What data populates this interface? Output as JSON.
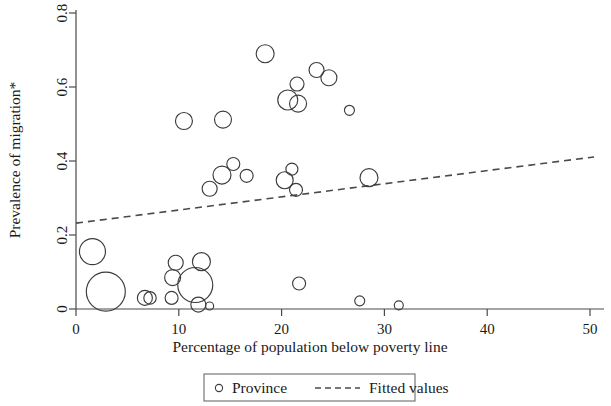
{
  "chart_data": {
    "type": "scatter",
    "title": "",
    "xlabel": "Percentage of population below poverty line",
    "ylabel": "Prevalence of migration*",
    "xlim": [
      0,
      50
    ],
    "ylim": [
      0,
      0.8
    ],
    "xticks": [
      "0",
      "10",
      "20",
      "30",
      "40",
      "50"
    ],
    "xtick_values": [
      0,
      10,
      20,
      30,
      40,
      50
    ],
    "yticks": [
      "0",
      "0.2",
      "0.4",
      "0.6",
      "0.8"
    ],
    "ytick_values": [
      0,
      0.2,
      0.4,
      0.6,
      0.8
    ],
    "grid": false,
    "marker_shape": "open-circle",
    "marker_note": "Bubble size encodes province weight (population)",
    "series": [
      {
        "name": "Province",
        "type": "bubble",
        "points": [
          {
            "x": 1.6,
            "y": 0.155,
            "size": 13.0
          },
          {
            "x": 2.9,
            "y": 0.047,
            "size": 19.5
          },
          {
            "x": 6.7,
            "y": 0.03,
            "size": 7.5
          },
          {
            "x": 7.2,
            "y": 0.03,
            "size": 6.2
          },
          {
            "x": 9.3,
            "y": 0.03,
            "size": 6.5
          },
          {
            "x": 9.4,
            "y": 0.085,
            "size": 8.0
          },
          {
            "x": 9.7,
            "y": 0.125,
            "size": 7.5
          },
          {
            "x": 11.6,
            "y": 0.065,
            "size": 17.5
          },
          {
            "x": 12.2,
            "y": 0.128,
            "size": 9.0
          },
          {
            "x": 11.9,
            "y": 0.012,
            "size": 7.5
          },
          {
            "x": 13.0,
            "y": 0.008,
            "size": 4.0
          },
          {
            "x": 10.5,
            "y": 0.508,
            "size": 8.5
          },
          {
            "x": 13.0,
            "y": 0.325,
            "size": 7.5
          },
          {
            "x": 14.2,
            "y": 0.362,
            "size": 9.0
          },
          {
            "x": 15.3,
            "y": 0.392,
            "size": 6.5
          },
          {
            "x": 16.6,
            "y": 0.36,
            "size": 6.5
          },
          {
            "x": 14.3,
            "y": 0.512,
            "size": 8.5
          },
          {
            "x": 18.4,
            "y": 0.69,
            "size": 9.0
          },
          {
            "x": 20.3,
            "y": 0.348,
            "size": 8.5
          },
          {
            "x": 21.0,
            "y": 0.378,
            "size": 6.0
          },
          {
            "x": 21.4,
            "y": 0.322,
            "size": 6.5
          },
          {
            "x": 20.6,
            "y": 0.565,
            "size": 10.0
          },
          {
            "x": 21.6,
            "y": 0.555,
            "size": 8.5
          },
          {
            "x": 21.5,
            "y": 0.608,
            "size": 7.0
          },
          {
            "x": 23.4,
            "y": 0.646,
            "size": 7.5
          },
          {
            "x": 24.6,
            "y": 0.625,
            "size": 8.0
          },
          {
            "x": 26.6,
            "y": 0.537,
            "size": 5.0
          },
          {
            "x": 21.7,
            "y": 0.069,
            "size": 6.5
          },
          {
            "x": 28.5,
            "y": 0.355,
            "size": 9.0
          },
          {
            "x": 27.6,
            "y": 0.022,
            "size": 5.0
          },
          {
            "x": 31.4,
            "y": 0.01,
            "size": 4.5
          }
        ]
      },
      {
        "name": "Fitted values",
        "type": "line",
        "style": "dashed",
        "endpoints": [
          {
            "x": 0,
            "y": 0.232
          },
          {
            "x": 50.4,
            "y": 0.411
          }
        ],
        "intercept": 0.232,
        "slope": 0.00355
      }
    ],
    "legend": {
      "position": "bottom-center",
      "boxed": true,
      "entries": [
        {
          "label": "Province",
          "marker": "open-circle"
        },
        {
          "label": "Fitted values",
          "marker": "dashed-line"
        }
      ]
    }
  },
  "colors": {
    "background": "#ffffff",
    "axis": "#4a4a4a",
    "marker_stroke": "#3c3c3c",
    "fit_line": "#4a4a4a",
    "legend_border": "#6a6a6a",
    "text": "#1a1a1a"
  }
}
